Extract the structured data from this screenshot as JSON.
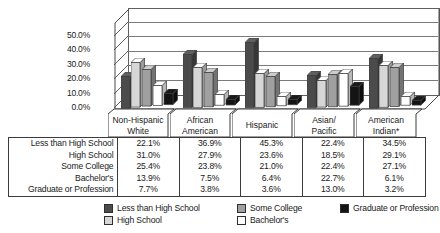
{
  "chart_data": {
    "type": "bar",
    "title": "",
    "subtitle": "",
    "xlabel": "",
    "ylabel": "",
    "ylim": [
      0,
      55
    ],
    "ytick_labels": [
      "0.0%",
      "10.0%",
      "20.0%",
      "30.0%",
      "40.0%",
      "50.0%"
    ],
    "ytick_values": [
      0,
      10,
      20,
      30,
      40,
      50
    ],
    "grid": true,
    "three_d": true,
    "legend_position": "bottom",
    "categories": [
      "Non-Hispanic White",
      "African American",
      "Hispanic",
      "Asian/ Pacific",
      "American Indian*"
    ],
    "category_lines": [
      [
        "Non-Hispanic",
        "White"
      ],
      [
        "African",
        "American"
      ],
      [
        "Hispanic",
        ""
      ],
      [
        "Asian/",
        "Pacific"
      ],
      [
        "American",
        "Indian*"
      ]
    ],
    "series": [
      {
        "name": "Less than High School",
        "color": "#4b4b4b",
        "values": [
          22.1,
          36.9,
          45.3,
          22.4,
          34.5
        ],
        "labels": [
          "22.1%",
          "36.9%",
          "45.3%",
          "22.4%",
          "34.5%"
        ]
      },
      {
        "name": "High School",
        "color": "#d6d6d6",
        "values": [
          31.0,
          27.9,
          23.6,
          18.5,
          29.1
        ],
        "labels": [
          "31.0%",
          "27.9%",
          "23.6%",
          "18.5%",
          "29.1%"
        ]
      },
      {
        "name": "Some College",
        "color": "#a0a0a0",
        "values": [
          25.4,
          23.8,
          21.0,
          22.4,
          27.1
        ],
        "labels": [
          "25.4%",
          "23.8%",
          "21.0%",
          "22.4%",
          "27.1%"
        ]
      },
      {
        "name": "Bachelor's",
        "color": "#ffffff",
        "values": [
          13.9,
          7.5,
          6.4,
          22.7,
          6.1
        ],
        "labels": [
          "13.9%",
          "7.5%",
          "6.4%",
          "22.7%",
          "6.1%"
        ]
      },
      {
        "name": "Graduate or Profession",
        "color": "#141414",
        "values": [
          7.7,
          3.8,
          3.6,
          13.0,
          3.2
        ],
        "labels": [
          "7.7%",
          "3.8%",
          "3.6%",
          "13.0%",
          "3.2%"
        ]
      }
    ]
  },
  "table": {
    "row_labels": [
      "Less than High School",
      "High School",
      "Some College",
      "Bachelor's",
      "Graduate or Profession"
    ],
    "rows": [
      [
        "22.1%",
        "36.9%",
        "45.3%",
        "22.4%",
        "34.5%"
      ],
      [
        "31.0%",
        "27.9%",
        "23.6%",
        "18.5%",
        "29.1%"
      ],
      [
        "25.4%",
        "23.8%",
        "21.0%",
        "22.4%",
        "27.1%"
      ],
      [
        "13.9%",
        "7.5%",
        "6.4%",
        "22.7%",
        "6.1%"
      ],
      [
        "7.7%",
        "3.8%",
        "3.6%",
        "13.0%",
        "3.2%"
      ]
    ]
  },
  "legend": {
    "items": [
      {
        "label": "Less than High School",
        "color": "#4b4b4b"
      },
      {
        "label": "High School",
        "color": "#d6d6d6"
      },
      {
        "label": "Some College",
        "color": "#a0a0a0"
      },
      {
        "label": "Bachelor's",
        "color": "#ffffff"
      },
      {
        "label": "Graduate or Profession",
        "color": "#141414"
      }
    ]
  }
}
